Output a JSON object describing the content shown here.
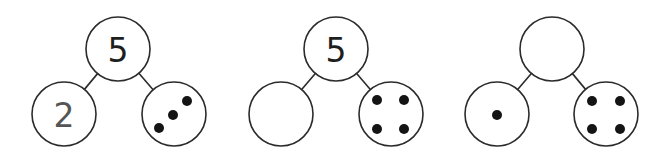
{
  "colors": {
    "stroke": "#2b2b2b",
    "dot": "#141414",
    "whole_number": "#1e1e1e",
    "part_number": "#555555",
    "background": "#ffffff"
  },
  "bonds": [
    {
      "id": "bond-1",
      "whole": {
        "cx": 118,
        "cy": 49,
        "r": 32,
        "label": "5"
      },
      "left": {
        "cx": 64,
        "cy": 114,
        "r": 32,
        "label": "2",
        "dots": []
      },
      "right": {
        "cx": 174,
        "cy": 114,
        "r": 32,
        "label": "",
        "dots": [
          {
            "x": 187,
            "y": 101
          },
          {
            "x": 173,
            "y": 115
          },
          {
            "x": 159,
            "y": 128
          }
        ]
      }
    },
    {
      "id": "bond-2",
      "whole": {
        "cx": 336,
        "cy": 49,
        "r": 32,
        "label": "5"
      },
      "left": {
        "cx": 281,
        "cy": 114,
        "r": 32,
        "label": "",
        "dots": []
      },
      "right": {
        "cx": 391,
        "cy": 114,
        "r": 32,
        "label": "",
        "dots": [
          {
            "x": 377,
            "y": 100
          },
          {
            "x": 404,
            "y": 100
          },
          {
            "x": 377,
            "y": 129
          },
          {
            "x": 404,
            "y": 129
          }
        ]
      }
    },
    {
      "id": "bond-3",
      "whole": {
        "cx": 552,
        "cy": 49,
        "r": 32,
        "label": ""
      },
      "left": {
        "cx": 497,
        "cy": 114,
        "r": 32,
        "label": "",
        "dots": [
          {
            "x": 497,
            "y": 115
          }
        ]
      },
      "right": {
        "cx": 606,
        "cy": 114,
        "r": 32,
        "label": "",
        "dots": [
          {
            "x": 592,
            "y": 101
          },
          {
            "x": 620,
            "y": 101
          },
          {
            "x": 592,
            "y": 129
          },
          {
            "x": 620,
            "y": 129
          }
        ]
      }
    }
  ],
  "dot_radius": 5
}
